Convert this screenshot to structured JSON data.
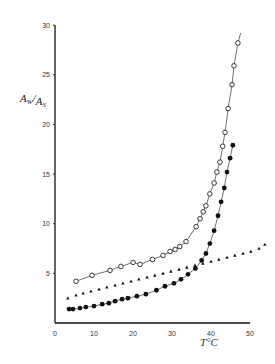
{
  "chart_data": {
    "type": "scatter",
    "title": "",
    "xlabel": "T°C",
    "ylabel": "Aw/As",
    "ylabel_parts": {
      "a": "A",
      "sub1": "W",
      "slash": "/",
      "b": "A",
      "sub2": "S"
    },
    "xlabel_parts": {
      "t": "T",
      "unit": "°C"
    },
    "xlim": [
      0,
      50
    ],
    "ylim": [
      0,
      30
    ],
    "xticks": [
      0,
      10,
      20,
      30,
      40,
      50
    ],
    "yticks": [
      5,
      10,
      15,
      20,
      25,
      30
    ],
    "grid": false,
    "legend": null,
    "series": [
      {
        "name": "open circles",
        "marker": "open-circle",
        "line": true,
        "points": [
          [
            5.4,
            4.2
          ],
          [
            9.5,
            4.8
          ],
          [
            14.1,
            5.3
          ],
          [
            16.9,
            5.7
          ],
          [
            20.0,
            6.1
          ],
          [
            21.8,
            5.9
          ],
          [
            25.0,
            6.4
          ],
          [
            27.7,
            6.8
          ],
          [
            29.5,
            7.2
          ],
          [
            30.8,
            7.4
          ],
          [
            32.0,
            7.7
          ],
          [
            33.6,
            8.2
          ],
          [
            36.2,
            9.7
          ],
          [
            37.2,
            10.5
          ],
          [
            38.0,
            11.2
          ],
          [
            38.7,
            11.8
          ],
          [
            39.7,
            13.0
          ],
          [
            40.8,
            14.1
          ],
          [
            41.5,
            15.2
          ],
          [
            42.3,
            16.2
          ],
          [
            43.0,
            17.8
          ],
          [
            43.6,
            19.2
          ],
          [
            44.4,
            21.6
          ],
          [
            45.4,
            24.0
          ],
          [
            45.9,
            25.9
          ],
          [
            46.9,
            28.2
          ]
        ],
        "line_end": [
          47.6,
          29.2
        ]
      },
      {
        "name": "filled circles",
        "marker": "filled-circle",
        "line": true,
        "points": [
          [
            3.6,
            1.4
          ],
          [
            4.6,
            1.4
          ],
          [
            6.4,
            1.5
          ],
          [
            7.9,
            1.6
          ],
          [
            10.0,
            1.7
          ],
          [
            12.1,
            1.9
          ],
          [
            13.8,
            2.0
          ],
          [
            15.4,
            2.2
          ],
          [
            17.2,
            2.4
          ],
          [
            18.7,
            2.5
          ],
          [
            21.0,
            2.7
          ],
          [
            23.3,
            2.9
          ],
          [
            26.0,
            3.3
          ],
          [
            28.2,
            3.7
          ],
          [
            30.5,
            4.0
          ],
          [
            32.3,
            4.4
          ],
          [
            34.1,
            4.9
          ],
          [
            36.0,
            5.5
          ],
          [
            37.6,
            6.3
          ],
          [
            38.7,
            7.0
          ],
          [
            39.7,
            8.0
          ],
          [
            40.8,
            9.3
          ],
          [
            41.8,
            10.8
          ],
          [
            42.6,
            12.2
          ],
          [
            43.4,
            13.6
          ],
          [
            44.1,
            15.2
          ],
          [
            44.9,
            16.6
          ],
          [
            45.6,
            17.9
          ]
        ]
      },
      {
        "name": "triangles",
        "marker": "filled-triangle",
        "line": false,
        "points": [
          [
            3.3,
            2.5
          ],
          [
            5.4,
            2.8
          ],
          [
            7.2,
            3.0
          ],
          [
            9.2,
            3.2
          ],
          [
            11.3,
            3.4
          ],
          [
            13.3,
            3.6
          ],
          [
            15.4,
            3.8
          ],
          [
            17.4,
            4.0
          ],
          [
            19.5,
            4.2
          ],
          [
            21.5,
            4.4
          ],
          [
            23.6,
            4.6
          ],
          [
            25.6,
            4.8
          ],
          [
            27.7,
            5.0
          ],
          [
            29.7,
            5.2
          ],
          [
            31.8,
            5.4
          ],
          [
            33.8,
            5.6
          ],
          [
            35.9,
            5.8
          ],
          [
            37.9,
            6.0
          ],
          [
            40.0,
            6.2
          ],
          [
            42.0,
            6.4
          ],
          [
            44.1,
            6.6
          ],
          [
            46.1,
            6.8
          ],
          [
            48.2,
            7.0
          ],
          [
            50.2,
            7.2
          ],
          [
            52.3,
            7.5
          ],
          [
            53.8,
            7.9
          ]
        ]
      }
    ]
  },
  "axes": {
    "plot_px": {
      "x0": 55,
      "x_per_unit": 3.9,
      "y0": 323,
      "y_per_unit": 9.93,
      "x_axis_end": 250
    }
  }
}
